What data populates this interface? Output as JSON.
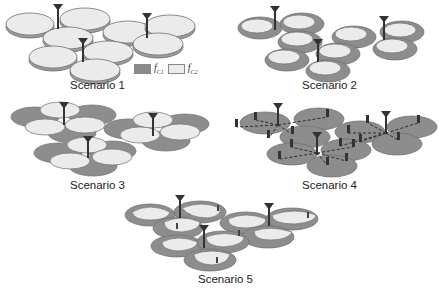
{
  "figure": {
    "scenarios": [
      {
        "id": 1,
        "label": "Scenario 1",
        "description": "Single-tier macro cells, three-sector sites, all sectors on carrier f_C2"
      },
      {
        "id": 2,
        "label": "Scenario 2",
        "description": "Macro sectors with inner f_C2 zone and outer f_C1 ring"
      },
      {
        "id": 3,
        "label": "Scenario 3",
        "description": "Overlapping f_C1 and f_C2 sector layers with rotated orientation"
      },
      {
        "id": 4,
        "label": "Scenario 4",
        "description": "Macro cells with distributed remote radio heads connected by dashed links"
      },
      {
        "id": 5,
        "label": "Scenario 5",
        "description": "Macro f_C2 coverage with small cells/repeaters extending f_C1 coverage"
      }
    ],
    "legend": {
      "items": [
        {
          "symbol": "f",
          "subscript": "C1",
          "color": "#8a8a8a"
        },
        {
          "symbol": "f",
          "subscript": "C2",
          "color": "#ececec"
        }
      ]
    },
    "colors": {
      "dark_cell": "#8d8d8d",
      "light_cell": "#ebebeb",
      "cell_edge": "#6e6e6e",
      "tower": "#333333"
    }
  }
}
